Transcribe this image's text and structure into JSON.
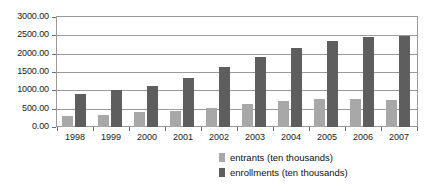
{
  "chart_data": {
    "type": "bar",
    "title": "",
    "subtitle": "",
    "xlabel": "",
    "ylabel": "",
    "grid": true,
    "legend_position": "bottom-right",
    "categories": [
      "1998",
      "1999",
      "2000",
      "2001",
      "2002",
      "2003",
      "2004",
      "2005",
      "2006",
      "2007"
    ],
    "ylim": [
      0,
      3000
    ],
    "ytick_labels": [
      "0.00",
      "500.00",
      "1000.00",
      "1500.00",
      "2000.00",
      "2500.00",
      "3000.00"
    ],
    "ytick_values": [
      0,
      500,
      1000,
      1500,
      2000,
      2500,
      3000
    ],
    "series": [
      {
        "name": "entrants (ten thousands)",
        "color": "#a8a8a8",
        "values": [
          300,
          340,
          400,
          430,
          530,
          620,
          700,
          760,
          770,
          730
        ]
      },
      {
        "name": "enrollments (ten thousands)",
        "color": "#5e5e5e",
        "values": [
          900,
          1000,
          1130,
          1340,
          1640,
          1920,
          2150,
          2350,
          2450,
          2480
        ]
      }
    ]
  },
  "legend": {
    "entries": [
      {
        "label": "entrants (ten thousands)",
        "swatch_name": "legend-swatch-entrants"
      },
      {
        "label": "enrollments (ten thousands)",
        "swatch_name": "legend-swatch-enrollments"
      }
    ]
  },
  "colors": {
    "entrants": "#a8a8a8",
    "enrollments": "#5e5e5e",
    "gridline": "#9a9a9a",
    "axis_text": "#1a1a1a",
    "background": "#ffffff"
  }
}
